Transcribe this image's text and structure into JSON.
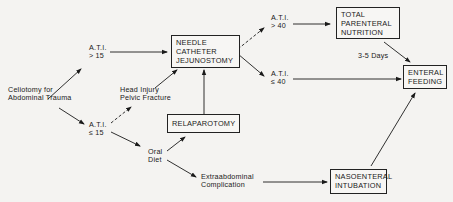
{
  "diagram": {
    "nodes": {
      "start": {
        "text": "Celiotomy for\nAbdominal Trauma"
      },
      "ati_gt15": {
        "text": "A.T.I.\n> 15"
      },
      "ati_le15": {
        "text": "A.T.I.\n≤ 15"
      },
      "head_injury": {
        "text": "Head Injury\nPelvic Fracture"
      },
      "oral_diet": {
        "text": "Oral\nDiet"
      },
      "needle_cath": {
        "text": "NEEDLE\nCATHETER\nJEJUNOSTOMY"
      },
      "relaparotomy": {
        "text": "RELAPAROTOMY"
      },
      "extraabdominal": {
        "text": "Extraabdominal\nComplication"
      },
      "ati_gt40": {
        "text": "A.T.I.\n> 40"
      },
      "ati_le40": {
        "text": "A.T.I.\n≤ 40"
      },
      "tpn": {
        "text": "TOTAL\nPARENTERAL\nNUTRITION"
      },
      "days": {
        "text": "3-5 Days"
      },
      "enteral": {
        "text": "ENTERAL\nFEEDING"
      },
      "naso": {
        "text": "NASOENTERAL\nINTUBATION"
      }
    },
    "edges": [
      {
        "from": "start",
        "to": "ati_gt15",
        "style": "solid"
      },
      {
        "from": "start",
        "to": "ati_le15",
        "style": "solid"
      },
      {
        "from": "ati_gt15",
        "to": "needle_cath",
        "style": "solid"
      },
      {
        "from": "ati_le15",
        "to": "head_injury",
        "style": "dashed"
      },
      {
        "from": "head_injury",
        "to": "needle_cath",
        "style": "solid"
      },
      {
        "from": "ati_le15",
        "to": "oral_diet",
        "style": "solid"
      },
      {
        "from": "oral_diet",
        "to": "relaparotomy",
        "style": "solid"
      },
      {
        "from": "relaparotomy",
        "to": "needle_cath",
        "style": "solid"
      },
      {
        "from": "oral_diet",
        "to": "extraabdominal",
        "style": "solid"
      },
      {
        "from": "extraabdominal",
        "to": "naso",
        "style": "solid"
      },
      {
        "from": "needle_cath",
        "to": "ati_gt40",
        "style": "dashed"
      },
      {
        "from": "needle_cath",
        "to": "ati_le40",
        "style": "solid"
      },
      {
        "from": "ati_gt40",
        "to": "tpn",
        "style": "solid"
      },
      {
        "from": "tpn",
        "to": "enteral",
        "style": "solid",
        "label": "3-5 Days"
      },
      {
        "from": "ati_le40",
        "to": "enteral",
        "style": "solid"
      },
      {
        "from": "naso",
        "to": "enteral",
        "style": "solid"
      }
    ]
  }
}
